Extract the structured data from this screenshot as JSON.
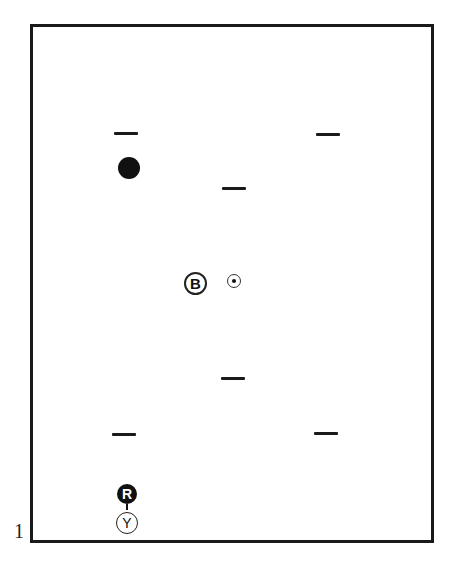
{
  "figure": {
    "label": "1",
    "frame": {
      "color": "#1a1a1a"
    },
    "markers": [
      {
        "type": "dash",
        "x": 126,
        "y": 133
      },
      {
        "type": "dash",
        "x": 328,
        "y": 134
      },
      {
        "type": "dash",
        "x": 234,
        "y": 188
      },
      {
        "type": "dash",
        "x": 233,
        "y": 378
      },
      {
        "type": "dash",
        "x": 124,
        "y": 434
      },
      {
        "type": "dash",
        "x": 326,
        "y": 433
      }
    ],
    "solid_dot": {
      "x": 129,
      "y": 168
    },
    "center_ball": {
      "label": "B",
      "x": 195,
      "y": 283
    },
    "target_spot": {
      "x": 234,
      "y": 281
    },
    "red_ball": {
      "label": "R",
      "x": 127,
      "y": 494
    },
    "yellow_ball": {
      "label": "Y",
      "x": 127,
      "y": 524
    }
  }
}
